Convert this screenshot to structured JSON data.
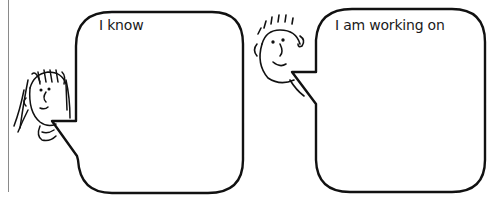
{
  "worksheet": {
    "panels": [
      {
        "id": "left",
        "character": "girl-with-straight-hair",
        "bubble_label": "I know",
        "bubble_content": ""
      },
      {
        "id": "right",
        "character": "boy-with-spiky-hair",
        "bubble_label": "I am working on",
        "bubble_content": ""
      }
    ],
    "colors": {
      "background": "#ffffff",
      "ink": "#111111",
      "margin_rule": "#8a8a8a"
    }
  }
}
